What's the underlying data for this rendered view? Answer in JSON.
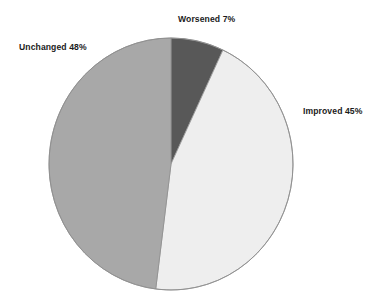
{
  "chart_data": {
    "type": "pie",
    "title": "",
    "subtitle": "",
    "xlabel": "",
    "ylabel": "",
    "grid": false,
    "legend_position": "none",
    "labels_position": "outside-callout",
    "start_angle_deg": 0,
    "direction": "clockwise",
    "categories": [
      "Worsened",
      "Improved",
      "Unchanged"
    ],
    "values": [
      7,
      45,
      48
    ],
    "units": "percent",
    "total": 100,
    "slices": [
      {
        "name": "Worsened",
        "value": 7,
        "label": "Worsened 7%",
        "color": "#585858",
        "start_deg": 0,
        "end_deg": 25.2
      },
      {
        "name": "Improved",
        "value": 45,
        "label": "Improved 45%",
        "color": "#eeeeee",
        "start_deg": 25.2,
        "end_deg": 187.2
      },
      {
        "name": "Unchanged",
        "value": 48,
        "label": "Unchanged 48%",
        "color": "#a8a8a8",
        "start_deg": 187.2,
        "end_deg": 360
      }
    ],
    "annotations": []
  },
  "labels": {
    "worsened": "Worsened 7%",
    "unchanged": "Unchanged 48%",
    "improved": "Improved 45%"
  },
  "style": {
    "background": "#ffffff",
    "outline": "#8f8f8f",
    "text": "#1b1b1b",
    "color_worsened": "#585858",
    "color_improved": "#eeeeee",
    "color_unchanged": "#a8a8a8"
  },
  "geometry": {
    "cx": 171,
    "cy": 164,
    "rx": 122,
    "ry": 126
  }
}
